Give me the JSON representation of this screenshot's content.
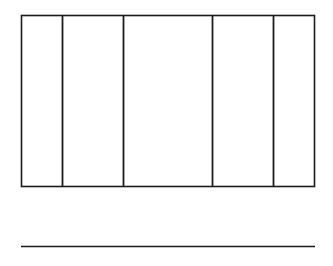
{
  "figure": {
    "type": "engineering-section-diagram",
    "stroke_color": "#1b1b1b",
    "background_color": "#ffffff",
    "fill_color": "#ffffff"
  },
  "outline": {
    "name": "outer-rectangle",
    "x": 21,
    "y": 15,
    "width": 294,
    "height": 172
  },
  "columns": [
    {
      "name": "left-braided-column",
      "x": 62,
      "width": 62,
      "pattern": "zigzag-braid",
      "periods": 5
    },
    {
      "name": "right-braided-column",
      "x": 212,
      "width": 62,
      "pattern": "zigzag-braid",
      "periods": 5
    }
  ],
  "dimension_line": {
    "name": "dimension-chain",
    "y": 246,
    "tick_style": "cross",
    "extension_line_top": 190,
    "segments": [
      {
        "label": "s",
        "start": 21,
        "end": 62,
        "center": 41.5,
        "meaning": "spacing"
      },
      {
        "label": "d",
        "start": 62,
        "end": 124,
        "center": 93,
        "meaning": "column width"
      },
      {
        "label": "2s",
        "start": 124,
        "end": 212,
        "center": 168,
        "meaning": "double spacing"
      },
      {
        "label": "d",
        "start": 212,
        "end": 274,
        "center": 243,
        "meaning": "column width"
      },
      {
        "label": "s",
        "start": 274,
        "end": 315,
        "center": 294.5,
        "meaning": "spacing"
      }
    ]
  },
  "labels": {
    "s_left": "s",
    "d_left": "d",
    "two_s": "2s",
    "d_right": "d",
    "s_right": "s"
  }
}
